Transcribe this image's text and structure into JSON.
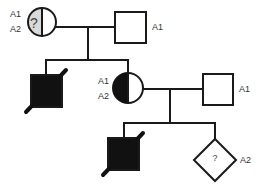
{
  "diagram": {
    "type": "pedigree",
    "colors": {
      "affected": "#111111",
      "unknown_shading": "#d9d9d9",
      "unaffected": "#ffffff",
      "line": "#1a1a1a",
      "label": "#333333"
    },
    "generations": [
      {
        "id": "I",
        "individuals": [
          {
            "id": "I-1",
            "sex": "female",
            "status": "unknown-carrier",
            "symbol_text": "?",
            "alleles": [
              "A1",
              "A2"
            ]
          },
          {
            "id": "I-2",
            "sex": "male",
            "status": "unaffected",
            "alleles": [
              "A1"
            ]
          }
        ]
      },
      {
        "id": "II",
        "individuals": [
          {
            "id": "II-1",
            "sex": "male",
            "status": "affected-deceased",
            "alleles": []
          },
          {
            "id": "II-2",
            "sex": "female",
            "status": "carrier",
            "alleles": [
              "A1",
              "A2"
            ]
          },
          {
            "id": "II-3",
            "sex": "male",
            "status": "unaffected",
            "alleles": [
              "A1"
            ]
          }
        ]
      },
      {
        "id": "III",
        "individuals": [
          {
            "id": "III-1",
            "sex": "male",
            "status": "affected-deceased",
            "alleles": []
          },
          {
            "id": "III-2",
            "sex": "unknown",
            "status": "unknown",
            "symbol_text": "?",
            "alleles": [
              "A2"
            ]
          }
        ]
      }
    ],
    "labels": {
      "i1_a1": "A1",
      "i1_a2": "A2",
      "i1_q": "?",
      "i2_a1": "A1",
      "ii2_a1": "A1",
      "ii2_a2": "A2",
      "ii3_a1": "A1",
      "iii2_q": "?",
      "iii2_a2": "A2"
    }
  }
}
